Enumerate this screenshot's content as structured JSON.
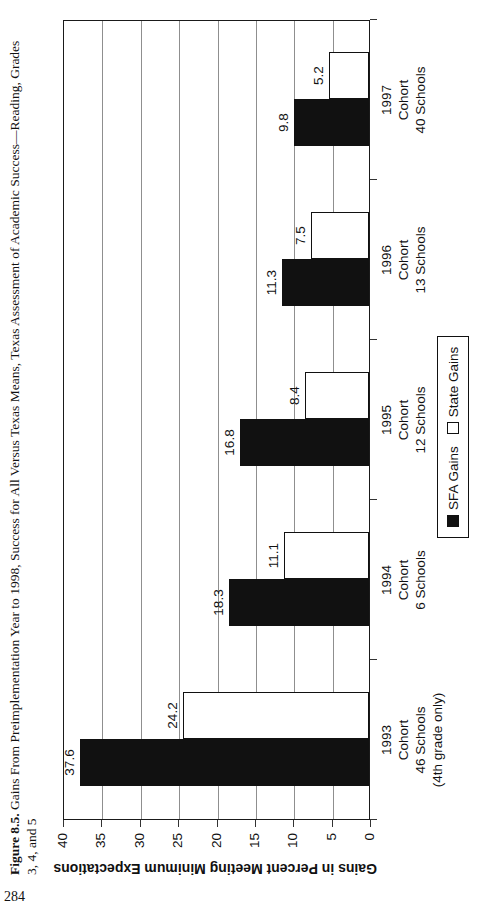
{
  "page": {
    "number": "284"
  },
  "figure": {
    "caption_label": "Figure 8.5.",
    "caption_text": "Gains From Preimplementation Year to 1998, Success for All Versus Texas Means, Texas Assessment of Academic Success—Reading, Grades",
    "caption_line2": "3, 4, and 5"
  },
  "chart_data": {
    "type": "bar",
    "title": "",
    "xlabel": "",
    "ylabel": "Gains in Percent Meeting Minimum Expectations",
    "ylim": [
      0,
      40
    ],
    "yticks": [
      0,
      5,
      10,
      15,
      20,
      25,
      30,
      35,
      40
    ],
    "grid": true,
    "legend_position": "bottom-center",
    "categories": [
      [
        "1993",
        "Cohort",
        "46 Schools",
        "(4th grade only)"
      ],
      [
        "1994",
        "Cohort",
        "6 Schools"
      ],
      [
        "1995",
        "Cohort",
        "12 Schools"
      ],
      [
        "1996",
        "Cohort",
        "13 Schools"
      ],
      [
        "1997",
        "Cohort",
        "40 Schools"
      ]
    ],
    "series": [
      {
        "name": "SFA Gains",
        "fill": "#111111",
        "values": [
          37.6,
          18.3,
          16.8,
          11.3,
          9.8
        ]
      },
      {
        "name": "State Gains",
        "fill": "#ffffff",
        "values": [
          24.2,
          11.1,
          8.4,
          7.5,
          5.2
        ]
      }
    ]
  },
  "colors": {
    "ink": "#111111",
    "gridline": "#8f8f8f",
    "paper": "#ffffff"
  }
}
